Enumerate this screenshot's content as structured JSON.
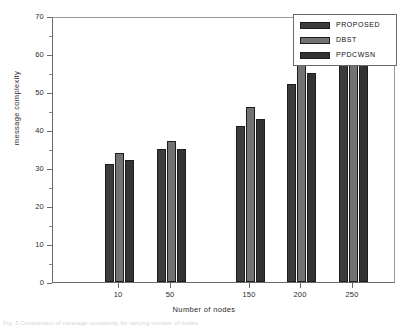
{
  "chart_data": {
    "type": "bar",
    "title": "",
    "xlabel": "Number of nodes",
    "ylabel": "message complexity",
    "categories": [
      "10",
      "50",
      "150",
      "200",
      "250"
    ],
    "series": [
      {
        "name": "PROPOSED",
        "color": "#3c3c3c",
        "values": [
          31,
          35,
          41,
          52,
          65
        ]
      },
      {
        "name": "DBST",
        "color": "#737373",
        "values": [
          34,
          37,
          46,
          58,
          68
        ]
      },
      {
        "name": "PPDCWSN",
        "color": "#333333",
        "values": [
          32,
          35,
          43,
          55,
          66
        ]
      }
    ],
    "ylim": [
      0,
      70
    ],
    "ytick_labels": [
      "0",
      "10",
      "20",
      "30",
      "40",
      "50",
      "60",
      "70"
    ],
    "ytick_values": [
      0,
      10,
      20,
      30,
      40,
      50,
      60,
      70
    ],
    "yminor_step": 5,
    "grid": false,
    "legend_position": "top-right"
  },
  "legend": {
    "entries": [
      {
        "label": "PROPOSED"
      },
      {
        "label": "DBST"
      },
      {
        "label": "PPDCWSN"
      }
    ]
  },
  "caption": {
    "text": "Fig. 5 Comparison of message complexity for varying number of nodes"
  }
}
